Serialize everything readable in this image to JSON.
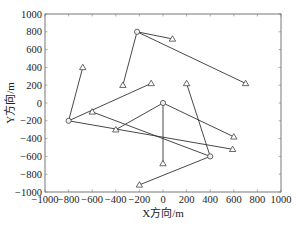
{
  "chart_data": {
    "type": "scatter",
    "title": "",
    "xlabel": "X方向/m",
    "ylabel": "Y方向/m",
    "xlim": [
      -1000,
      1000
    ],
    "ylim": [
      -1000,
      1000
    ],
    "xticks": [
      -1000,
      -800,
      -600,
      -400,
      -200,
      0,
      200,
      400,
      600,
      800,
      1000
    ],
    "yticks": [
      -1000,
      -800,
      -600,
      -400,
      -200,
      0,
      200,
      400,
      600,
      800,
      1000
    ],
    "grid": false,
    "legend": null,
    "series": [
      {
        "name": "centers",
        "marker": "circle",
        "points": [
          {
            "x": -220,
            "y": 800
          },
          {
            "x": -800,
            "y": -200
          },
          {
            "x": 0,
            "y": 0
          },
          {
            "x": 400,
            "y": -600
          }
        ]
      },
      {
        "name": "nodes",
        "marker": "triangle",
        "points": [
          {
            "x": 80,
            "y": 720
          },
          {
            "x": 700,
            "y": 220
          },
          {
            "x": -340,
            "y": 200
          },
          {
            "x": -680,
            "y": 400
          },
          {
            "x": -100,
            "y": 220
          },
          {
            "x": 590,
            "y": -520
          },
          {
            "x": 0,
            "y": -680
          },
          {
            "x": 600,
            "y": -380
          },
          {
            "x": -600,
            "y": -100
          },
          {
            "x": -400,
            "y": -300
          },
          {
            "x": 200,
            "y": 220
          },
          {
            "x": -200,
            "y": -920
          }
        ]
      }
    ],
    "links": [
      {
        "from": [
          -220,
          800
        ],
        "to": [
          80,
          720
        ]
      },
      {
        "from": [
          -220,
          800
        ],
        "to": [
          700,
          220
        ]
      },
      {
        "from": [
          -220,
          800
        ],
        "to": [
          -340,
          200
        ]
      },
      {
        "from": [
          -800,
          -200
        ],
        "to": [
          -680,
          400
        ]
      },
      {
        "from": [
          -800,
          -200
        ],
        "to": [
          -100,
          220
        ]
      },
      {
        "from": [
          -800,
          -200
        ],
        "to": [
          590,
          -520
        ]
      },
      {
        "from": [
          0,
          0
        ],
        "to": [
          0,
          -680
        ]
      },
      {
        "from": [
          0,
          0
        ],
        "to": [
          600,
          -380
        ]
      },
      {
        "from": [
          0,
          0
        ],
        "to": [
          -400,
          -300
        ]
      },
      {
        "from": [
          400,
          -600
        ],
        "to": [
          -600,
          -100
        ]
      },
      {
        "from": [
          400,
          -600
        ],
        "to": [
          200,
          220
        ]
      },
      {
        "from": [
          400,
          -600
        ],
        "to": [
          -200,
          -920
        ]
      }
    ]
  }
}
